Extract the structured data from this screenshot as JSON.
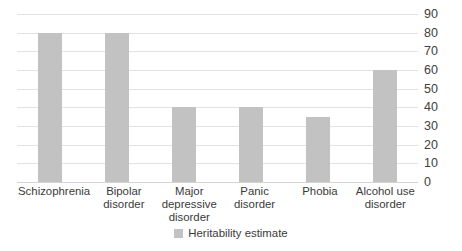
{
  "chart_data": {
    "type": "bar",
    "title": "",
    "subtitle": "",
    "xlabel": "",
    "ylabel": "",
    "categories": [
      "Schizophrenia",
      "Bipolar disorder",
      "Major depressive disorder",
      "Panic disorder",
      "Phobia",
      "Alcohol use disorder"
    ],
    "series": [
      {
        "name": "Heritability estimate",
        "values": [
          80,
          80,
          40,
          40,
          35,
          60
        ],
        "color": "#c2c2c2"
      }
    ],
    "values": [
      80,
      80,
      40,
      40,
      35,
      60
    ],
    "ylim": [
      0,
      90
    ],
    "ytick_step": 10,
    "ytick_labels": [
      "90",
      "80",
      "70",
      "60",
      "50",
      "40",
      "30",
      "20",
      "10",
      "0"
    ],
    "yaxis_position": "right",
    "grid": true,
    "grid_axis": "y",
    "grid_color": "#e2e2e2",
    "legend": {
      "position": "bottom",
      "entries": [
        {
          "label": "Heritability estimate",
          "color": "#c2c2c2"
        }
      ]
    },
    "annotations": [],
    "background_color": "#ffffff"
  }
}
